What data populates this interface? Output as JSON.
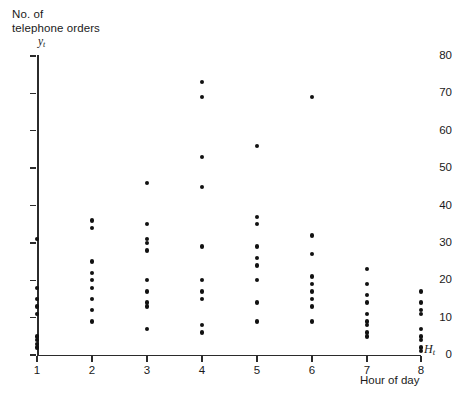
{
  "figure": {
    "y_axis_title": "No. of\ntelephone orders",
    "y_axis_symbol": "y",
    "y_axis_symbol_sub": "t",
    "x_axis_symbol": "H",
    "x_axis_symbol_sub": "t",
    "x_axis_title": "Hour of day",
    "point_color": "#111111",
    "axis_color": "#2b2b2b",
    "background_color": "#ffffff"
  },
  "chart_data": {
    "type": "scatter",
    "title": "",
    "xlabel": "Hour of day",
    "ylabel": "No. of telephone orders",
    "x_symbol": "H_t",
    "y_symbol": "y_t",
    "xlim": [
      0.6,
      8.6
    ],
    "ylim": [
      0,
      80
    ],
    "xticks": [
      1,
      2,
      3,
      4,
      5,
      6,
      7,
      8
    ],
    "xticklabels": [
      "1",
      "2",
      "3",
      "4",
      "5",
      "6",
      "7",
      "8"
    ],
    "yticks": [
      0,
      10,
      20,
      30,
      40,
      50,
      60,
      70,
      80
    ],
    "yticklabels": [
      "0",
      "10",
      "20",
      "30",
      "40",
      "50",
      "60",
      "70",
      "80"
    ],
    "grid": false,
    "legend": false,
    "marker": "filled-circle",
    "series": [
      {
        "name": "telephone orders",
        "points": [
          {
            "x": 1,
            "y": 31
          },
          {
            "x": 1,
            "y": 18
          },
          {
            "x": 1,
            "y": 15
          },
          {
            "x": 1,
            "y": 13
          },
          {
            "x": 1,
            "y": 11
          },
          {
            "x": 1,
            "y": 5
          },
          {
            "x": 1,
            "y": 4
          },
          {
            "x": 1,
            "y": 3
          },
          {
            "x": 1,
            "y": 2
          },
          {
            "x": 2,
            "y": 36
          },
          {
            "x": 2,
            "y": 34
          },
          {
            "x": 2,
            "y": 25
          },
          {
            "x": 2,
            "y": 22
          },
          {
            "x": 2,
            "y": 20
          },
          {
            "x": 2,
            "y": 18
          },
          {
            "x": 2,
            "y": 15
          },
          {
            "x": 2,
            "y": 12
          },
          {
            "x": 2,
            "y": 9
          },
          {
            "x": 3,
            "y": 46
          },
          {
            "x": 3,
            "y": 35
          },
          {
            "x": 3,
            "y": 31
          },
          {
            "x": 3,
            "y": 30
          },
          {
            "x": 3,
            "y": 28
          },
          {
            "x": 3,
            "y": 20
          },
          {
            "x": 3,
            "y": 17
          },
          {
            "x": 3,
            "y": 14
          },
          {
            "x": 3,
            "y": 13
          },
          {
            "x": 3,
            "y": 7
          },
          {
            "x": 4,
            "y": 73
          },
          {
            "x": 4,
            "y": 69
          },
          {
            "x": 4,
            "y": 53
          },
          {
            "x": 4,
            "y": 45
          },
          {
            "x": 4,
            "y": 29
          },
          {
            "x": 4,
            "y": 20
          },
          {
            "x": 4,
            "y": 17
          },
          {
            "x": 4,
            "y": 15
          },
          {
            "x": 4,
            "y": 8
          },
          {
            "x": 4,
            "y": 6
          },
          {
            "x": 5,
            "y": 56
          },
          {
            "x": 5,
            "y": 37
          },
          {
            "x": 5,
            "y": 35
          },
          {
            "x": 5,
            "y": 29
          },
          {
            "x": 5,
            "y": 26
          },
          {
            "x": 5,
            "y": 24
          },
          {
            "x": 5,
            "y": 20
          },
          {
            "x": 5,
            "y": 14
          },
          {
            "x": 5,
            "y": 9
          },
          {
            "x": 6,
            "y": 69
          },
          {
            "x": 6,
            "y": 32
          },
          {
            "x": 6,
            "y": 27
          },
          {
            "x": 6,
            "y": 21
          },
          {
            "x": 6,
            "y": 19
          },
          {
            "x": 6,
            "y": 17
          },
          {
            "x": 6,
            "y": 15
          },
          {
            "x": 6,
            "y": 13
          },
          {
            "x": 6,
            "y": 9
          },
          {
            "x": 7,
            "y": 23
          },
          {
            "x": 7,
            "y": 19
          },
          {
            "x": 7,
            "y": 16
          },
          {
            "x": 7,
            "y": 14
          },
          {
            "x": 7,
            "y": 11
          },
          {
            "x": 7,
            "y": 9
          },
          {
            "x": 7,
            "y": 8
          },
          {
            "x": 7,
            "y": 6
          },
          {
            "x": 7,
            "y": 5
          },
          {
            "x": 8,
            "y": 17
          },
          {
            "x": 8,
            "y": 14
          },
          {
            "x": 8,
            "y": 12
          },
          {
            "x": 8,
            "y": 11
          },
          {
            "x": 8,
            "y": 7
          },
          {
            "x": 8,
            "y": 5
          },
          {
            "x": 8,
            "y": 4
          },
          {
            "x": 8,
            "y": 2
          },
          {
            "x": 8,
            "y": 1
          }
        ]
      }
    ]
  }
}
